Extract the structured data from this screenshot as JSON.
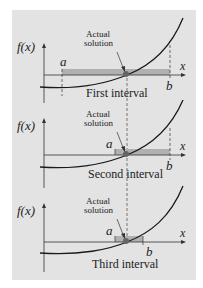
{
  "colors": {
    "panel_bg": "#e3e3e3",
    "curve": "#1a1a1a",
    "interval_fill": "#b8b8b8",
    "axis": "#333333",
    "root_dot": "#555555"
  },
  "graphs": [
    {
      "y_label": "f(x)",
      "x_label": "x",
      "a_label": "a",
      "b_label": "b",
      "annotation_line1": "Actual",
      "annotation_line2": "solution",
      "caption": "First interval"
    },
    {
      "y_label": "f(x)",
      "x_label": "x",
      "a_label": "a",
      "b_label": "b",
      "annotation_line1": "Actual",
      "annotation_line2": "solution",
      "caption": "Second interval"
    },
    {
      "y_label": "f(x)",
      "x_label": "x",
      "a_label": "a",
      "b_label": "b",
      "annotation_line1": "Actual",
      "annotation_line2": "solution",
      "caption": "Third interval"
    }
  ]
}
